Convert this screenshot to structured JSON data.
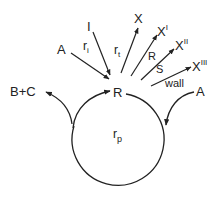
{
  "diagram": {
    "type": "reaction-cycle",
    "center_species": "R",
    "cycle_label": "r",
    "cycle_label_sub": "p",
    "colors": {
      "stroke": "#222222",
      "background": "#ffffff"
    },
    "inputs": [
      {
        "species": "A",
        "rate": "r",
        "rate_sub": "i",
        "position": "top-left"
      },
      {
        "species": "I",
        "position": "top-left"
      },
      {
        "species": "A",
        "position": "right",
        "note": "enters propagation cycle"
      }
    ],
    "outputs": [
      {
        "species": "X",
        "rate": "r",
        "rate_sub": "t"
      },
      {
        "species": "X",
        "sup": "I",
        "via": "R"
      },
      {
        "species": "X",
        "sup": "II",
        "via": "S"
      },
      {
        "species": "X",
        "sup": "III",
        "via": "wall"
      },
      {
        "species": "B+C",
        "position": "left",
        "note": "leaves propagation cycle"
      }
    ]
  },
  "labels": {
    "R_center": "R",
    "A_left": "A",
    "ri_main": "r",
    "ri_sub": "i",
    "I": "I",
    "rt_main": "r",
    "rt_sub": "t",
    "X": "X",
    "XI_main": "X",
    "XI_sup": "I",
    "XII_main": "X",
    "XII_sup": "II",
    "XIII_main": "X",
    "XIII_sup": "III",
    "R_path": "R",
    "S_path": "S",
    "wall": "wall",
    "BC": "B+C",
    "A_right": "A",
    "rp_main": "r",
    "rp_sub": "p"
  }
}
